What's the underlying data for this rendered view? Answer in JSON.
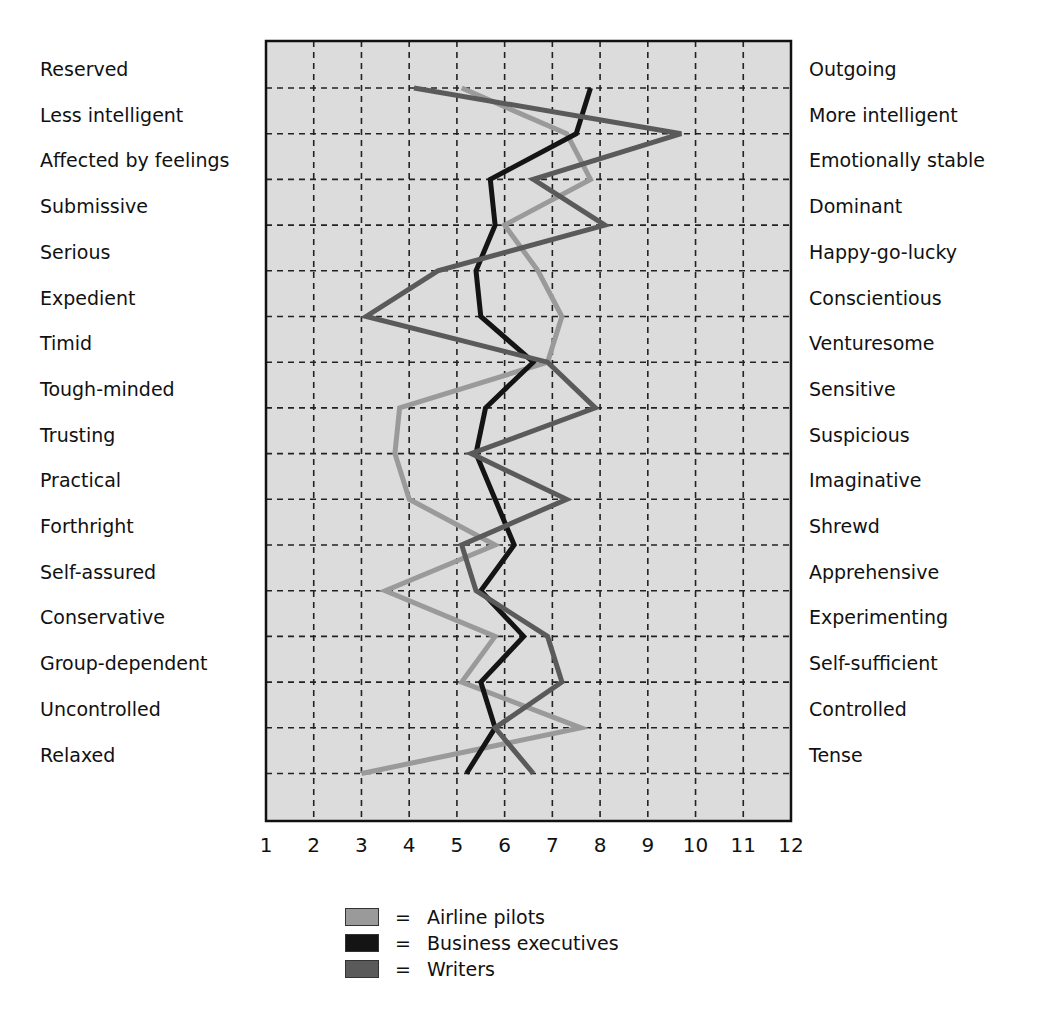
{
  "chart_data": {
    "type": "line",
    "orientation": "horizontal-profile",
    "title": "",
    "xlabel": "",
    "ylabel": "",
    "xlim": [
      1,
      12
    ],
    "x_ticks": [
      "1",
      "2",
      "3",
      "4",
      "5",
      "6",
      "7",
      "8",
      "9",
      "10",
      "11",
      "12"
    ],
    "grid": true,
    "legend_position": "bottom",
    "left_labels": [
      "Reserved",
      "Less intelligent",
      "Affected by feelings",
      "Submissive",
      "Serious",
      "Expedient",
      "Timid",
      "Tough-minded",
      "Trusting",
      "Practical",
      "Forthright",
      "Self-assured",
      "Conservative",
      "Group-dependent",
      "Uncontrolled",
      "Relaxed"
    ],
    "right_labels": [
      "Outgoing",
      "More intelligent",
      "Emotionally stable",
      "Dominant",
      "Happy-go-lucky",
      "Conscientious",
      "Venturesome",
      "Sensitive",
      "Suspicious",
      "Imaginative",
      "Shrewd",
      "Apprehensive",
      "Experimenting",
      "Self-sufficient",
      "Controlled",
      "Tense"
    ],
    "series": [
      {
        "name": "Airline pilots",
        "color": "#9a9a9a",
        "values": [
          5.1,
          7.3,
          7.8,
          6.0,
          6.7,
          7.2,
          6.9,
          3.8,
          3.7,
          4.0,
          5.8,
          3.5,
          5.8,
          5.1,
          7.6,
          3.0
        ]
      },
      {
        "name": "Business executives",
        "color": "#141414",
        "values": [
          7.8,
          7.5,
          5.7,
          5.8,
          5.4,
          5.5,
          6.6,
          5.6,
          5.4,
          5.8,
          6.2,
          5.5,
          6.4,
          5.5,
          5.8,
          5.2
        ]
      },
      {
        "name": "Writers",
        "color": "#5a5a5a",
        "values": [
          4.1,
          9.7,
          6.6,
          8.1,
          4.6,
          3.1,
          6.9,
          7.9,
          5.3,
          7.3,
          5.1,
          5.4,
          6.9,
          7.2,
          5.8,
          6.6
        ]
      }
    ]
  },
  "legend": {
    "equals": "=",
    "items": [
      {
        "label": "Airline pilots",
        "color": "#9a9a9a"
      },
      {
        "label": "Business executives",
        "color": "#141414"
      },
      {
        "label": "Writers",
        "color": "#5a5a5a"
      }
    ]
  },
  "colors": {
    "plot_background": "#dcdcdc",
    "frame": "#111111",
    "grid": "#222222"
  }
}
